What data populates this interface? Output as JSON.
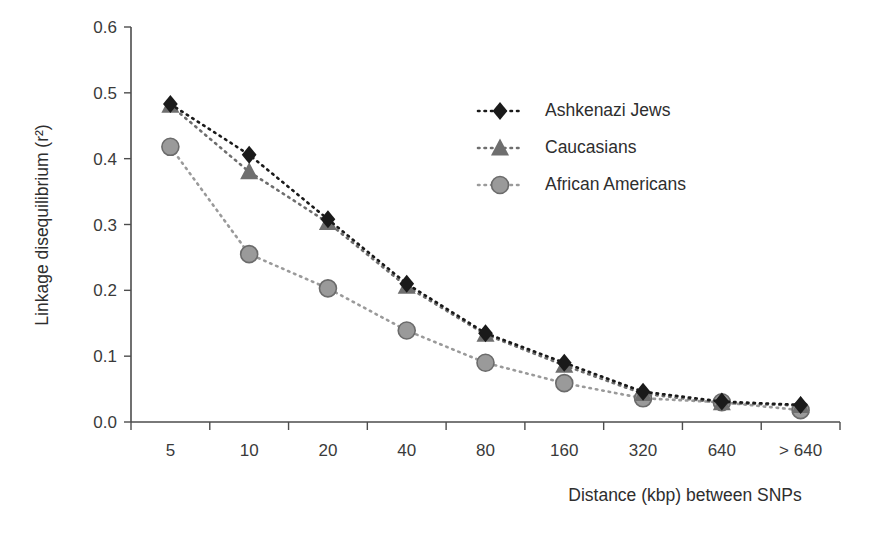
{
  "chart_data": {
    "type": "line",
    "title": "",
    "xlabel": "Distance (kbp) between SNPs",
    "ylabel": "Linkage disequilibrium (r²)",
    "categories": [
      "5",
      "10",
      "20",
      "40",
      "80",
      "160",
      "320",
      "640",
      "> 640"
    ],
    "ylim": [
      0.0,
      0.6
    ],
    "ytick_labels": [
      "0.0",
      "0.1",
      "0.2",
      "0.3",
      "0.4",
      "0.5",
      "0.6"
    ],
    "ytick_values": [
      0.0,
      0.1,
      0.2,
      0.3,
      0.4,
      0.5,
      0.6
    ],
    "grid": false,
    "legend_position": "upper right inside",
    "series": [
      {
        "name": "Ashkenazi Jews",
        "marker": "diamond",
        "color": "#1a1a1a",
        "line_style": "dotted",
        "values": [
          0.483,
          0.406,
          0.308,
          0.21,
          0.135,
          0.09,
          0.046,
          0.031,
          0.026
        ]
      },
      {
        "name": "Caucasians",
        "marker": "triangle",
        "color": "#6e6e6e",
        "line_style": "dotted",
        "values": [
          0.481,
          0.38,
          0.303,
          0.206,
          0.133,
          0.086,
          0.043,
          0.029,
          0.025
        ]
      },
      {
        "name": "African Americans",
        "marker": "circle",
        "color": "#9a9a9a",
        "line_style": "dotted",
        "values": [
          0.418,
          0.255,
          0.203,
          0.139,
          0.09,
          0.059,
          0.036,
          0.03,
          0.018
        ]
      }
    ]
  },
  "legend": {
    "items": [
      {
        "label": "Ashkenazi Jews"
      },
      {
        "label": "Caucasians"
      },
      {
        "label": "African Americans"
      }
    ]
  }
}
